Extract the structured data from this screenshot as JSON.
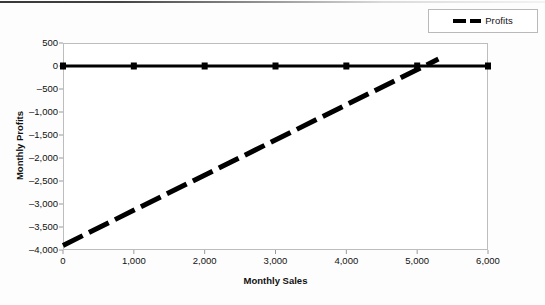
{
  "legend": {
    "position": "top-right",
    "entries": [
      {
        "label": "Profits",
        "style": "dashed",
        "color": "#000000"
      }
    ]
  },
  "chart_data": {
    "type": "line",
    "title": "",
    "xlabel": "Monthly Sales",
    "ylabel": "Monthly Profits",
    "xlim": [
      0,
      6000
    ],
    "ylim": [
      -4000,
      500
    ],
    "xticks": [
      "0",
      "1,000",
      "2,000",
      "3,000",
      "4,000",
      "5,000",
      "6,000"
    ],
    "xtick_values": [
      0,
      1000,
      2000,
      3000,
      4000,
      5000,
      6000
    ],
    "yticks": [
      "500",
      "0",
      "-500",
      "-1,000",
      "-1,500",
      "-2,000",
      "-2,500",
      "-3,000",
      "-3,500",
      "-4,000"
    ],
    "ytick_values": [
      500,
      0,
      -500,
      -1000,
      -1500,
      -2000,
      -2500,
      -3000,
      -3500,
      -4000
    ],
    "grid": false,
    "legend_position": "top-right",
    "series": [
      {
        "name": "Baseline",
        "style": "solid",
        "marker": "square",
        "color": "#000000",
        "x": [
          0,
          1000,
          2000,
          3000,
          4000,
          5000,
          6000
        ],
        "values": [
          0,
          0,
          0,
          0,
          0,
          0,
          0
        ]
      },
      {
        "name": "Profits",
        "style": "dashed",
        "marker": "none",
        "color": "#000000",
        "x": [
          0,
          5300
        ],
        "values": [
          -3900,
          150
        ]
      }
    ]
  }
}
